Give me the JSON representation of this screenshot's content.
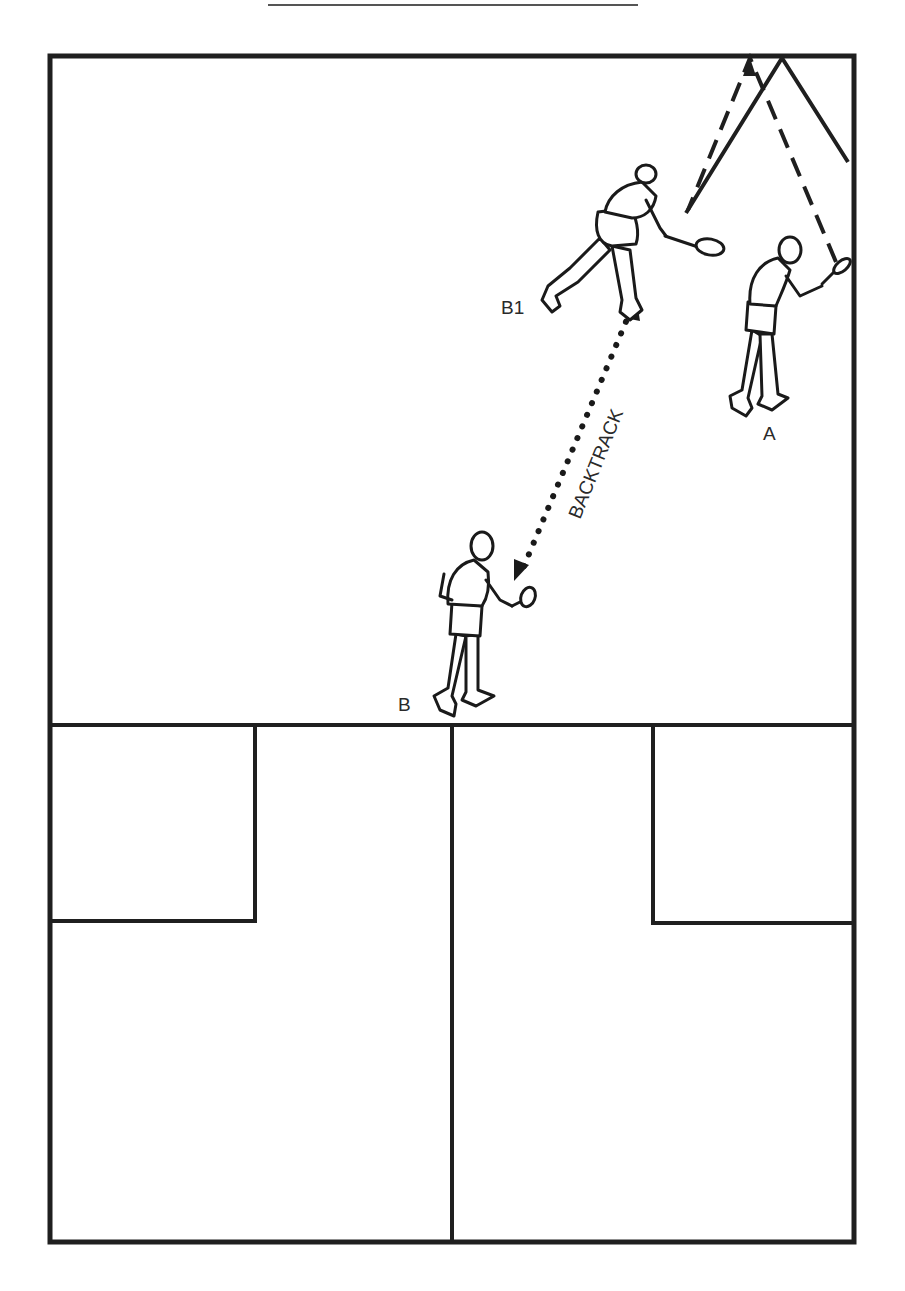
{
  "diagram": {
    "type": "court-diagram",
    "colors": {
      "line": "#1f1f1f",
      "background": "#ffffff",
      "text": "#2a2a2a"
    },
    "header_rule": {
      "x1": 268,
      "x2": 638,
      "y": 5
    },
    "court": {
      "outer": {
        "left": 50,
        "top": 56,
        "right": 854,
        "bottom": 1242
      },
      "short_line_y": 725,
      "center_line_x": 452,
      "service_boxes": [
        {
          "side": "left",
          "x1": 50,
          "x2": 255,
          "y1": 725,
          "y2": 921
        },
        {
          "side": "right",
          "x1": 653,
          "x2": 854,
          "y1": 725,
          "y2": 923
        }
      ]
    },
    "players": [
      {
        "id": "B1",
        "label": "B1",
        "label_pos": [
          501,
          314
        ],
        "description": "player lunging to return ball near front wall"
      },
      {
        "id": "A",
        "label": "A",
        "label_pos": [
          763,
          440
        ],
        "description": "player hitting ball near right wall"
      },
      {
        "id": "B",
        "label": "B",
        "label_pos": [
          398,
          711
        ],
        "description": "player at short line"
      }
    ],
    "movement": {
      "label": "BACKTRACK",
      "style": "dotted-double-arrow",
      "from": [
        516,
        578
      ],
      "to": [
        636,
        298
      ]
    },
    "ball_paths": [
      {
        "style": "dashed",
        "points": [
          [
            836,
            262
          ],
          [
            750,
            58
          ],
          [
            688,
            210
          ]
        ]
      },
      {
        "style": "solid",
        "points": [
          [
            686,
            213
          ],
          [
            782,
            58
          ],
          [
            848,
            162
          ]
        ]
      }
    ]
  }
}
